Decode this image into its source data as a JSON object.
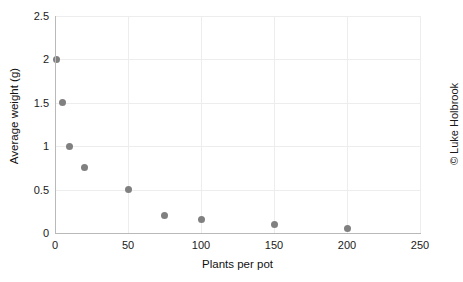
{
  "chart_data": {
    "type": "scatter",
    "title": "",
    "xlabel": "Plants per pot",
    "ylabel": "Average weight (g)",
    "xlim": [
      0,
      250
    ],
    "ylim": [
      0,
      2.5
    ],
    "xticks": [
      "0",
      "50",
      "100",
      "150",
      "200",
      "250"
    ],
    "xtick_values": [
      0,
      50,
      100,
      150,
      200,
      250
    ],
    "yticks": [
      "0",
      "0.5",
      "1",
      "1.5",
      "2",
      "2.5"
    ],
    "ytick_values": [
      0,
      0.5,
      1,
      1.5,
      2,
      2.5
    ],
    "grid": true,
    "legend": "none",
    "marker_color": "#808080",
    "grid_color": "#ededed",
    "axis_color": "#b9b9b9",
    "points": [
      {
        "x": 1,
        "y": 2
      },
      {
        "x": 5,
        "y": 1.5
      },
      {
        "x": 10,
        "y": 1
      },
      {
        "x": 20,
        "y": 0.75
      },
      {
        "x": 50,
        "y": 0.5
      },
      {
        "x": 75,
        "y": 0.2
      },
      {
        "x": 100,
        "y": 0.15
      },
      {
        "x": 150,
        "y": 0.1
      },
      {
        "x": 200,
        "y": 0.05
      }
    ]
  },
  "credit": {
    "text": "© Luke Holbrook"
  }
}
